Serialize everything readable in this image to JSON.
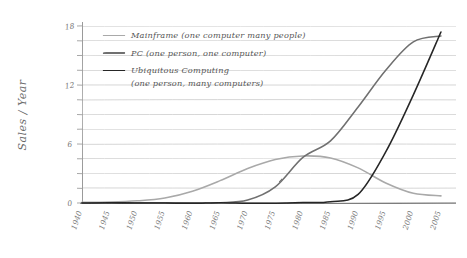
{
  "chart_data": {
    "type": "line",
    "title": "",
    "xlabel": "",
    "ylabel": "Sales / Year",
    "xlim": [
      1940,
      2007
    ],
    "ylim": [
      0,
      18
    ],
    "grid": true,
    "legend_position": "top-left",
    "style": "hand-drawn pencil sketch",
    "x_ticks": [
      "1940",
      "1945",
      "1950",
      "1955",
      "1960",
      "1965",
      "1970",
      "1975",
      "1980",
      "1985",
      "1990",
      "1995",
      "2000",
      "2005"
    ],
    "y_ticks": [
      "0",
      "6",
      "12",
      "18"
    ],
    "y_gridline_values": [
      0,
      1.5,
      3,
      4.5,
      6,
      7.5,
      9,
      10.5,
      12,
      13.5,
      15,
      16.5,
      18
    ],
    "series": [
      {
        "name": "Mainframe (one computer many people)",
        "short_name": "Mainframe",
        "color": "#a9a9a9",
        "x": [
          1940,
          1945,
          1950,
          1955,
          1960,
          1965,
          1970,
          1975,
          1980,
          1985,
          1990,
          1995,
          2000,
          2005
        ],
        "values": [
          0.05,
          0.1,
          0.2,
          0.5,
          1.2,
          2.3,
          3.5,
          4.4,
          4.8,
          4.6,
          3.6,
          2.0,
          1.0,
          0.7
        ]
      },
      {
        "name": "PC (one person, one computer)",
        "short_name": "PC",
        "color": "#707070",
        "x": [
          1940,
          1945,
          1950,
          1955,
          1960,
          1965,
          1970,
          1975,
          1980,
          1985,
          1990,
          1995,
          2000,
          2005
        ],
        "values": [
          0.0,
          0.0,
          0.0,
          0.0,
          0.0,
          0.05,
          0.3,
          1.6,
          4.6,
          6.3,
          9.8,
          13.5,
          16.4,
          17.0
        ]
      },
      {
        "name": "Ubiquitous Computing (one person, many computers)",
        "short_name": "Ubiquitous Computing",
        "color": "#262626",
        "x": [
          1940,
          1945,
          1950,
          1955,
          1960,
          1965,
          1970,
          1975,
          1980,
          1985,
          1990,
          1995,
          2000,
          2005
        ],
        "values": [
          0.0,
          0.0,
          0.0,
          0.0,
          0.0,
          0.0,
          0.0,
          0.0,
          0.05,
          0.1,
          0.9,
          5.2,
          11.0,
          17.4
        ]
      }
    ]
  },
  "legend": {
    "entries": [
      {
        "label": "Mainframe (one computer many people)",
        "label_line2": ""
      },
      {
        "label": "PC (one person, one computer)",
        "label_line2": ""
      },
      {
        "label": "Ubiquitous Computing",
        "label_line2": "(one person, many computers)"
      }
    ]
  },
  "axes": {
    "y_title": "Sales / Year"
  }
}
